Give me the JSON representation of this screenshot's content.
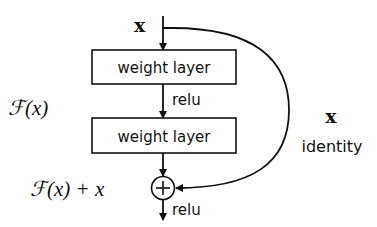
{
  "diagram": {
    "input_label": "x",
    "layers": [
      {
        "label": "weight layer"
      },
      {
        "label": "weight layer"
      }
    ],
    "activation_between": "relu",
    "activation_after_sum": "relu",
    "sum_symbol": "+",
    "residual_function_label": "ℱ(x)",
    "output_label": "ℱ(x) + x",
    "shortcut": {
      "variable_label": "x",
      "type_label": "identity"
    },
    "colors": {
      "stroke": "#111111",
      "background": "#ffffff"
    }
  }
}
